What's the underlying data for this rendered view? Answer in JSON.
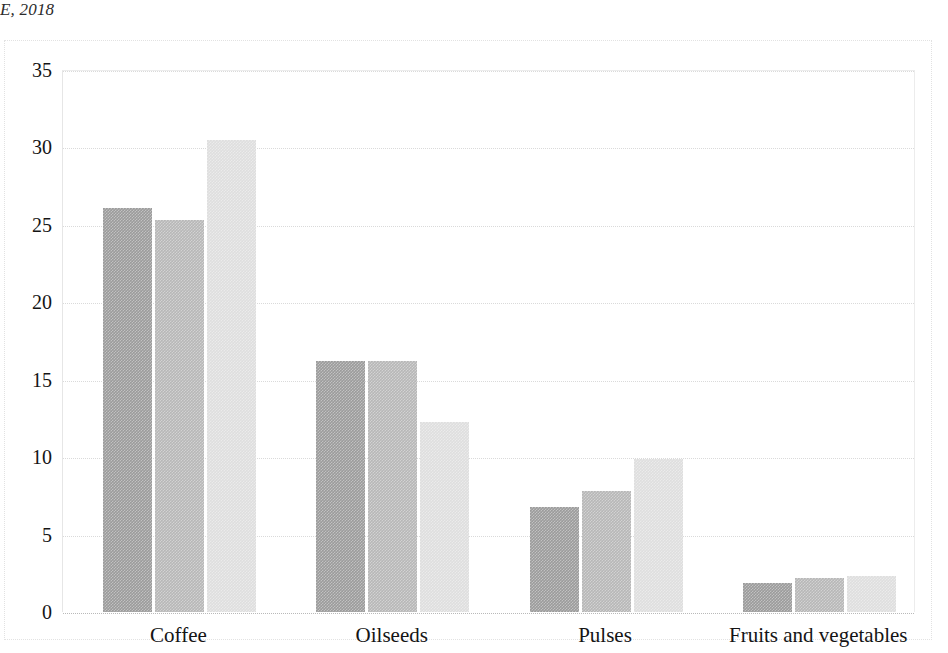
{
  "caption_fragment": "E, 2018",
  "chart_data": {
    "type": "bar",
    "title": "",
    "subtitle": "",
    "xlabel": "",
    "ylabel": "",
    "categories": [
      "Coffee",
      "Oilseeds",
      "Pulses",
      "Fruits and vegetables"
    ],
    "series": [
      {
        "name": "Series 1",
        "color": "#9b9b9b",
        "values": [
          26.1,
          16.2,
          6.8,
          1.9
        ]
      },
      {
        "name": "Series 2",
        "color": "#b7b7b7",
        "values": [
          25.3,
          16.2,
          7.8,
          2.2
        ]
      },
      {
        "name": "Series 3",
        "color": "#dedede",
        "values": [
          30.5,
          12.3,
          9.9,
          2.3
        ]
      }
    ],
    "ylim": [
      0,
      35
    ],
    "ytick_labels": [
      "0",
      "5",
      "10",
      "15",
      "20",
      "25",
      "30",
      "35"
    ],
    "ytick_values": [
      0,
      5,
      10,
      15,
      20,
      25,
      30,
      35
    ],
    "grid": true,
    "legend": "none"
  }
}
